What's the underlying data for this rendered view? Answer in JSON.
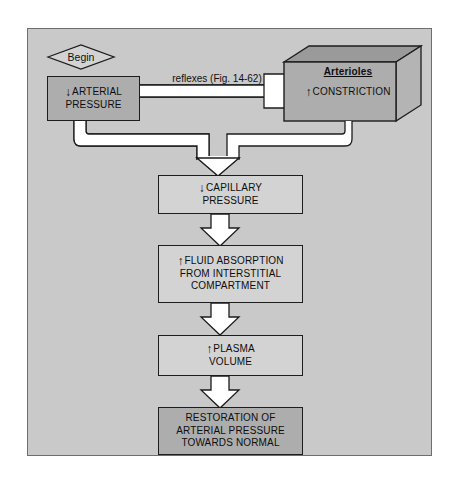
{
  "figure": {
    "type": "physiology-flowchart",
    "background_color": "#c9c9c9",
    "box_fill": "#d3d3d3",
    "box_fill_shaded": "#adadad",
    "outline_color": "#1d1d1d"
  },
  "start": {
    "label": "Begin",
    "shape": "diamond"
  },
  "nodes": [
    {
      "id": "arterial-pressure",
      "glyph": "↓",
      "lines": [
        "ARTERIAL",
        "PRESSURE"
      ],
      "style": "shaded"
    },
    {
      "id": "arterioles",
      "title": "Arterioles",
      "glyph": "↑",
      "lines": [
        "CONSTRICTION"
      ],
      "style": "three-d-shaded"
    },
    {
      "id": "capillary-pressure",
      "glyph": "↓",
      "lines": [
        "CAPILLARY",
        "PRESSURE"
      ],
      "style": "plain"
    },
    {
      "id": "fluid-absorption",
      "glyph": "↑",
      "lines": [
        "FLUID ABSORPTION",
        "FROM INTERSTITIAL",
        "COMPARTMENT"
      ],
      "style": "plain"
    },
    {
      "id": "plasma-volume",
      "glyph": "↑",
      "lines": [
        "PLASMA",
        "VOLUME"
      ],
      "style": "plain"
    },
    {
      "id": "restoration",
      "glyph": "",
      "lines": [
        "RESTORATION OF",
        "ARTERIAL PRESSURE",
        "TOWARDS NORMAL"
      ],
      "style": "shaded"
    }
  ],
  "edge_labels": {
    "reflexes_line1": "reflexes",
    "reflexes_line2": "(Fig. 14-62)"
  },
  "node_text": {
    "arterial_glyph": "↓",
    "arterial_l1": "ARTERIAL",
    "arterial_l2": "PRESSURE",
    "arterioles_title": "Arterioles",
    "arterioles_glyph": "↑",
    "arterioles_l1": "CONSTRICTION",
    "capillary_glyph": "↓",
    "capillary_l1": "CAPILLARY",
    "capillary_l2": "PRESSURE",
    "fluid_glyph": "↑",
    "fluid_l1": "FLUID ABSORPTION",
    "fluid_l2": "FROM INTERSTITIAL",
    "fluid_l3": "COMPARTMENT",
    "plasma_glyph": "↑",
    "plasma_l1": "PLASMA",
    "plasma_l2": "VOLUME",
    "restoration_l1": "RESTORATION OF",
    "restoration_l2": "ARTERIAL PRESSURE",
    "restoration_l3": "TOWARDS NORMAL"
  }
}
